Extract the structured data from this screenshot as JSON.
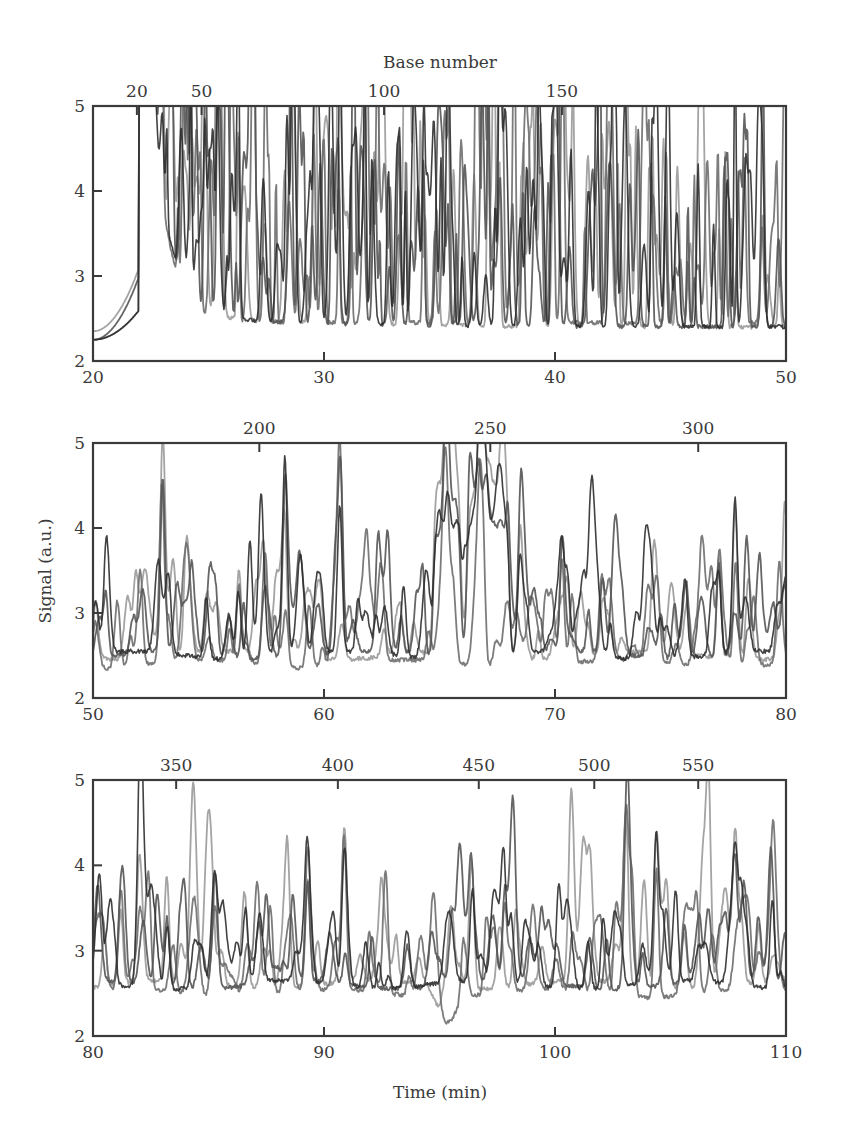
{
  "chart_data": {
    "type": "line",
    "title": "",
    "top_axis_title": "Base number",
    "ylabel": "Signal (a.u.)",
    "xlabel": "Time (min)",
    "legend": null,
    "grid": false,
    "series_names": [
      "trace-1 (light gray)",
      "trace-2 (medium gray)",
      "trace-3 (dark gray)",
      "trace-4 (darkest)"
    ],
    "series_colors": [
      "#9a9a9a",
      "#6e6e6e",
      "#555555",
      "#2e2e2e"
    ],
    "panels": [
      {
        "id": "top",
        "xlim": [
          20,
          50
        ],
        "ylim": [
          2,
          5
        ],
        "x_ticks": [
          20,
          30,
          40,
          50
        ],
        "y_ticks": [
          2,
          3,
          4,
          5
        ],
        "top_ticks": [
          {
            "label": "20",
            "x": 21.9
          },
          {
            "label": "50",
            "x": 24.7
          },
          {
            "label": "100",
            "x": 32.6
          },
          {
            "label": "150",
            "x": 40.3
          }
        ],
        "baseline_start": 2.25,
        "baseline_late": 2.4,
        "injection_jump_x": 22.0,
        "saturation_x_range": [
          22.0,
          22.6
        ],
        "peak_height_range": [
          3.2,
          4.8
        ],
        "notable_peaks": [
          {
            "x": 23.0,
            "y": 4.8
          },
          {
            "x": 26.3,
            "y": 4.55
          },
          {
            "x": 28.6,
            "y": 4.45
          },
          {
            "x": 34.3,
            "y": 4.4
          },
          {
            "x": 37.1,
            "y": 4.85
          },
          {
            "x": 37.6,
            "y": 4.3
          },
          {
            "x": 44.2,
            "y": 4.5
          }
        ]
      },
      {
        "id": "middle",
        "xlim": [
          50,
          80
        ],
        "ylim": [
          2,
          5
        ],
        "x_ticks": [
          50,
          60,
          70,
          80
        ],
        "y_ticks": [
          2,
          3,
          4,
          5
        ],
        "top_ticks": [
          {
            "label": "200",
            "x": 57.2
          },
          {
            "label": "250",
            "x": 67.2
          },
          {
            "label": "300",
            "x": 76.2
          }
        ],
        "baseline": 2.45,
        "notable_peaks": [
          {
            "x": 53.0,
            "y": 4.6
          },
          {
            "x": 56.3,
            "y": 3.4
          },
          {
            "x": 58.3,
            "y": 3.8
          },
          {
            "x": 60.7,
            "y": 4.1
          },
          {
            "x": 65.3,
            "y": 3.75
          },
          {
            "x": 66.8,
            "y": 3.7
          },
          {
            "x": 68.5,
            "y": 3.7
          },
          {
            "x": 70.3,
            "y": 3.75
          },
          {
            "x": 77.1,
            "y": 3.65
          },
          {
            "x": 77.8,
            "y": 3.75
          }
        ],
        "plateaus": [
          {
            "x_range": [
              64.8,
              66.0
            ],
            "y": 3.4
          },
          {
            "x_range": [
              66.3,
              68.0
            ],
            "y": 3.45
          }
        ]
      },
      {
        "id": "bottom",
        "xlim": [
          80,
          110
        ],
        "ylim": [
          2,
          5
        ],
        "x_ticks": [
          80,
          90,
          100,
          110
        ],
        "y_ticks": [
          2,
          3,
          4,
          5
        ],
        "top_ticks": [
          {
            "label": "350",
            "x": 83.6
          },
          {
            "label": "400",
            "x": 90.6
          },
          {
            "label": "450",
            "x": 96.7
          },
          {
            "label": "500",
            "x": 101.7
          },
          {
            "label": "550",
            "x": 106.2
          }
        ],
        "baseline": 2.55,
        "notable_peaks": [
          {
            "x": 81.2,
            "y": 3.4
          },
          {
            "x": 82.0,
            "y": 3.4
          },
          {
            "x": 83.2,
            "y": 3.45
          },
          {
            "x": 85.3,
            "y": 3.4
          },
          {
            "x": 89.3,
            "y": 3.8
          },
          {
            "x": 90.9,
            "y": 3.6
          },
          {
            "x": 96.4,
            "y": 3.75
          },
          {
            "x": 97.8,
            "y": 3.6
          },
          {
            "x": 103.1,
            "y": 4.25
          },
          {
            "x": 104.4,
            "y": 4.1
          },
          {
            "x": 107.8,
            "y": 3.8
          },
          {
            "x": 109.4,
            "y": 3.75
          }
        ],
        "dip": {
          "x_range": [
            94.5,
            96.0
          ],
          "y": 2.15
        }
      }
    ]
  },
  "figure": {
    "top_axis_title": "Base number",
    "y_axis_title": "Signal (a.u.)",
    "x_axis_title": "Time (min)"
  }
}
